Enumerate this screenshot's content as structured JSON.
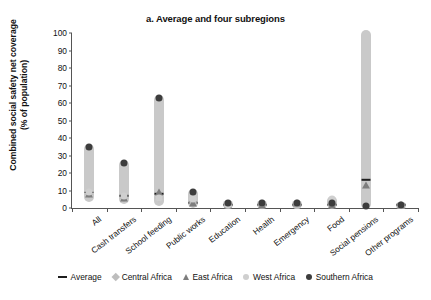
{
  "chart_data": {
    "type": "scatter",
    "title": "a. Average and four subregions",
    "xlabel": "",
    "ylabel_line1": "Combined social safety net coverage",
    "ylabel_line2": "(% of population)",
    "ylim": [
      0,
      100
    ],
    "yticks": [
      0,
      10,
      20,
      30,
      40,
      50,
      60,
      70,
      80,
      90,
      100
    ],
    "grid": false,
    "legend_position": "bottom",
    "categories": [
      "All",
      "Cash transfers",
      "School feeding",
      "Public works",
      "Education",
      "Health",
      "Emergency",
      "Food",
      "Social pensions",
      "Other programs"
    ],
    "ranges": [
      {
        "category": "All",
        "min": 5,
        "max": 35
      },
      {
        "category": "Cash transfers",
        "min": 4,
        "max": 26
      },
      {
        "category": "School feeding",
        "min": 3,
        "max": 63
      },
      {
        "category": "Public works",
        "min": 2,
        "max": 9
      },
      {
        "category": "Education",
        "min": 1,
        "max": 3
      },
      {
        "category": "Health",
        "min": 1,
        "max": 3
      },
      {
        "category": "Emergency",
        "min": 1,
        "max": 3
      },
      {
        "category": "Food",
        "min": 1,
        "max": 5
      },
      {
        "category": "Social pensions",
        "min": 1,
        "max": 100
      },
      {
        "category": "Other programs",
        "min": 1,
        "max": 2
      }
    ],
    "series": [
      {
        "name": "Average",
        "marker": "dash",
        "color": "#1e1e1e",
        "values": [
          9,
          7,
          8,
          3,
          2,
          2,
          2,
          2,
          16,
          2
        ]
      },
      {
        "name": "Central Africa",
        "marker": "diamond",
        "color": "#bdbdbd",
        "values": [
          8,
          6,
          6,
          3,
          2,
          2,
          2,
          2,
          2,
          2
        ]
      },
      {
        "name": "East Africa",
        "marker": "triangle",
        "color": "#7d7d7d",
        "values": [
          8,
          6,
          9,
          3,
          2,
          2,
          3,
          2,
          13,
          2
        ]
      },
      {
        "name": "West Africa",
        "marker": "circle-light",
        "color": "#cfcfcf",
        "values": [
          9,
          7,
          6,
          5,
          2,
          3,
          3,
          5,
          2,
          2
        ]
      },
      {
        "name": "Southern Africa",
        "marker": "circle-dark",
        "color": "#3d3d3d",
        "values": [
          35,
          26,
          63,
          9,
          3,
          3,
          3,
          3,
          1,
          2
        ]
      }
    ]
  },
  "legend": {
    "items": [
      {
        "label": "Average",
        "marker": "dash"
      },
      {
        "label": "Central Africa",
        "marker": "diamond"
      },
      {
        "label": "East Africa",
        "marker": "triangle"
      },
      {
        "label": "West Africa",
        "marker": "circle-light"
      },
      {
        "label": "Southern Africa",
        "marker": "circle-dark"
      }
    ]
  }
}
